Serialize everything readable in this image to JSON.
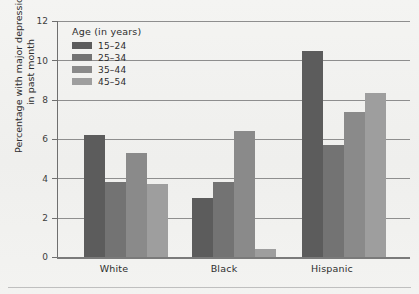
{
  "chart_data": {
    "type": "bar",
    "title": "",
    "subtitle": "",
    "xlabel": "",
    "ylabel": "Percentage with major depression in past month",
    "ylabel_lines": [
      "Percentage with major depression",
      "in past month"
    ],
    "categories": [
      "White",
      "Black",
      "Hispanic"
    ],
    "ylim": [
      0,
      12
    ],
    "yticks": [
      0,
      2,
      4,
      6,
      8,
      10,
      12
    ],
    "ytick_labels": [
      "0",
      "2",
      "4",
      "6",
      "8",
      "10",
      "12"
    ],
    "grid": true,
    "grid_axis": "y",
    "legend_position": "upper-left-inside",
    "legend_title": "Age (in years)",
    "series": [
      {
        "name": "15–24",
        "color": "#5c5c5c",
        "values": [
          6.2,
          3.0,
          10.5
        ]
      },
      {
        "name": "25–34",
        "color": "#737373",
        "values": [
          3.8,
          3.8,
          5.7
        ]
      },
      {
        "name": "35–44",
        "color": "#8a8a8a",
        "values": [
          5.3,
          6.4,
          7.35
        ]
      },
      {
        "name": "45–54",
        "color": "#9e9e9e",
        "values": [
          3.7,
          0.4,
          8.35
        ]
      }
    ]
  },
  "axis": {
    "y_title_line1": "Percentage with major depression",
    "y_title_line2": "in past month",
    "ytick_0": "0",
    "ytick_2": "2",
    "ytick_4": "4",
    "ytick_6": "6",
    "ytick_8": "8",
    "ytick_10": "10",
    "ytick_12": "12",
    "xcat_0": "White",
    "xcat_1": "Black",
    "xcat_2": "Hispanic"
  },
  "legend": {
    "title": "Age (in years)",
    "items": [
      {
        "label": "15–24",
        "color": "#5c5c5c"
      },
      {
        "label": "25–34",
        "color": "#737373"
      },
      {
        "label": "35–44",
        "color": "#8a8a8a"
      },
      {
        "label": "45–54",
        "color": "#9e9e9e"
      }
    ]
  },
  "colors": {
    "background": "#f2f2f0",
    "gridline": "#8e8e8e",
    "axis": "#6f6f6f",
    "text": "#2d2d2d",
    "rule": "#bfbfbf"
  }
}
